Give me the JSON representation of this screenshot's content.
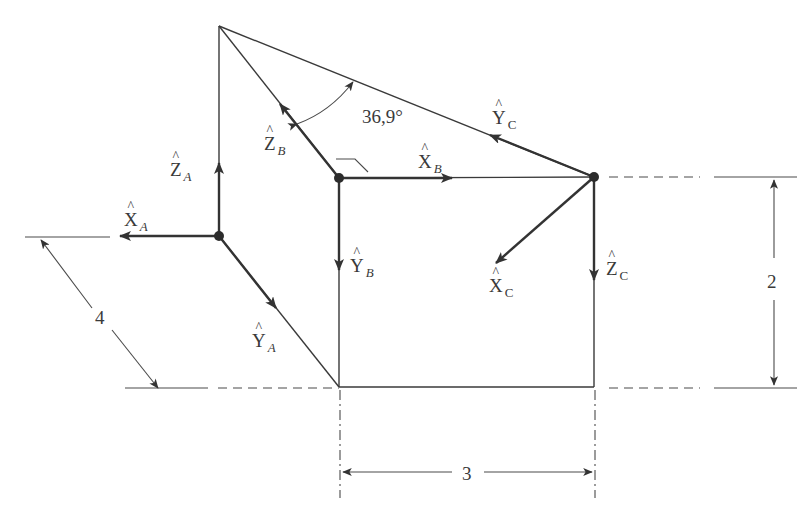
{
  "figure": {
    "type": "coordinate-frames-diagram",
    "frames": [
      {
        "name": "A",
        "origin": [
          219,
          236
        ],
        "vectors": [
          {
            "axis": "X",
            "label": "X",
            "subscript": "A",
            "direction": "left"
          },
          {
            "axis": "Y",
            "label": "Y",
            "subscript": "A",
            "direction": "down-right"
          },
          {
            "axis": "Z",
            "label": "Z",
            "subscript": "A",
            "direction": "up"
          }
        ]
      },
      {
        "name": "B",
        "origin": [
          339,
          178
        ],
        "vectors": [
          {
            "axis": "X",
            "label": "X",
            "subscript": "B",
            "direction": "right"
          },
          {
            "axis": "Y",
            "label": "Y",
            "subscript": "B",
            "direction": "down"
          },
          {
            "axis": "Z",
            "label": "Z",
            "subscript": "B",
            "direction": "up-left"
          }
        ]
      },
      {
        "name": "C",
        "origin": [
          594,
          177
        ],
        "vectors": [
          {
            "axis": "X",
            "label": "X",
            "subscript": "C",
            "direction": "down-left"
          },
          {
            "axis": "Y",
            "label": "Y",
            "subscript": "C",
            "direction": "up-left"
          },
          {
            "axis": "Z",
            "label": "Z",
            "subscript": "C",
            "direction": "down"
          }
        ]
      }
    ],
    "angle": {
      "label": "36,9°",
      "value": 36.9,
      "unit": "degrees"
    },
    "dimensions": [
      {
        "name": "depth",
        "label": "4",
        "value": 4
      },
      {
        "name": "height",
        "label": "2",
        "value": 2
      },
      {
        "name": "width",
        "label": "3",
        "value": 3
      }
    ]
  },
  "labels": {
    "xa": {
      "letter": "X",
      "sub": "A"
    },
    "ya": {
      "letter": "Y",
      "sub": "A"
    },
    "za": {
      "letter": "Z",
      "sub": "A"
    },
    "xb": {
      "letter": "X",
      "sub": "B"
    },
    "yb": {
      "letter": "Y",
      "sub": "B"
    },
    "zb": {
      "letter": "Z",
      "sub": "B"
    },
    "xc": {
      "letter": "X",
      "sub": "C"
    },
    "yc": {
      "letter": "Y",
      "sub": "C"
    },
    "zc": {
      "letter": "Z",
      "sub": "C"
    },
    "angle": "36,9°",
    "dim4": "4",
    "dim2": "2",
    "dim3": "3"
  },
  "colors": {
    "line": "#3a3a3a",
    "background": "#ffffff"
  }
}
